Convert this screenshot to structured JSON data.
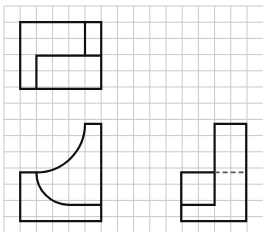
{
  "diagram": {
    "title": "",
    "grid": {
      "spacing": 16.2,
      "origin_x": 4,
      "origin_y": 6,
      "cols": 16,
      "rows": 14,
      "color": "#c8c8c8"
    },
    "stroke_color": "#111111",
    "figures": [
      {
        "name": "top-figure",
        "description": "Rectangle with inner L-shaped partition",
        "paths": [
          "M20.2 22.2 H101.2 V88.9 H20.2 Z",
          "M85 22.2 V55.6",
          "M36.4 88.9 V55.6 H101.2"
        ]
      },
      {
        "name": "bottom-left-figure",
        "description": "Block with two quarter-circle arcs",
        "paths": [
          "M20.2 172.4 H36.4 A48.6 48.6 0 0 0 85 123.8 H101.2 V221.2 H20.2 Z",
          "M36.4 172.4 A32.4 32.4 0 0 0 68.8 204.8 H101.2"
        ]
      },
      {
        "name": "bottom-right-figure",
        "description": "L-shaped block with hidden dashed edge",
        "paths": [
          "M214.6 123.8 H246.2 V221.2 H181.2 V172.4 H214.6 Z",
          "M181.2 204.8 H214.6 V172.4"
        ],
        "dashed": [
          "M214.6 172.4 H246.2"
        ]
      }
    ]
  }
}
